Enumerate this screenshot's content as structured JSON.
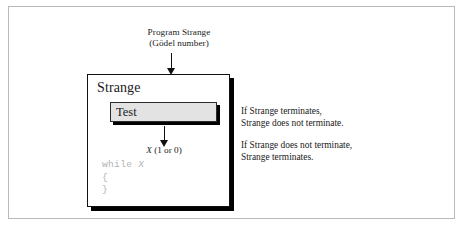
{
  "figure": {
    "input_label": {
      "line1": "Program Strange",
      "line2": "(Gödel number)"
    },
    "program_box": {
      "title": "Strange",
      "test_box_label": "Test",
      "output_label_var": "X",
      "output_label_rest": " (1 or 0)",
      "code": {
        "line1_keyword": "while ",
        "line1_var": "X",
        "line2": "{",
        "line3": "}"
      }
    },
    "statements": [
      {
        "line1": "If Strange terminates,",
        "line2": "Strange does not terminate."
      },
      {
        "line1": "If Strange does not terminate,",
        "line2": "Strange terminates."
      }
    ],
    "colors": {
      "frame_border": "#b9b9b9",
      "box_outline": "#111111",
      "shadow": "#000000",
      "test_fill": "#e3e3e3",
      "code_text": "#b3b3b3",
      "text": "#1a1a1a"
    }
  }
}
